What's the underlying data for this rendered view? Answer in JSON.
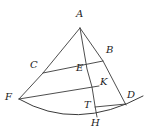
{
  "figure": {
    "kind": "geometry-diagram",
    "width": 148,
    "height": 139,
    "background_color": "#ffffff",
    "stroke_color": "#3a3a3a",
    "label_color": "#1c1c1c",
    "vertices": [
      {
        "id": "A",
        "label": "A",
        "x": 80,
        "y": 28,
        "label_x": 76,
        "label_y": 9
      },
      {
        "id": "B",
        "label": "B",
        "x": 103,
        "y": 61,
        "label_x": 106,
        "label_y": 45
      },
      {
        "id": "C",
        "label": "C",
        "x": 43,
        "y": 73,
        "label_x": 30,
        "label_y": 60
      },
      {
        "id": "E",
        "label": "E",
        "x": 87,
        "y": 69,
        "label_x": 76,
        "label_y": 63
      },
      {
        "id": "K",
        "label": "K",
        "x": 99,
        "y": 86,
        "label_x": 100,
        "label_y": 77
      },
      {
        "id": "F",
        "label": "F",
        "x": 19,
        "y": 99,
        "label_x": 5,
        "label_y": 92
      },
      {
        "id": "D",
        "label": "D",
        "x": 126,
        "y": 105,
        "label_x": 127,
        "label_y": 90
      },
      {
        "id": "T",
        "label": "T",
        "x": 95,
        "y": 106,
        "label_x": 84,
        "label_y": 100
      },
      {
        "id": "H",
        "label": "H",
        "x": 97,
        "y": 117,
        "label_x": 91,
        "label_y": 118
      }
    ],
    "segments": [
      {
        "id": "A-F",
        "from": "A",
        "to": "F",
        "through": "C"
      },
      {
        "id": "A-D",
        "from": "A",
        "to": "D",
        "through": "B"
      },
      {
        "id": "A-H",
        "from": "A",
        "to": "H",
        "through": "E, K, T"
      },
      {
        "id": "C-B",
        "from": "C",
        "to": "B"
      },
      {
        "id": "F-K",
        "from": "F",
        "to": "K"
      },
      {
        "id": "T-D",
        "from": "T",
        "to": "D"
      }
    ],
    "arcs": [
      {
        "id": "arc-F-H-right",
        "from": "F",
        "through": "H",
        "to": "right-of-D"
      }
    ]
  }
}
